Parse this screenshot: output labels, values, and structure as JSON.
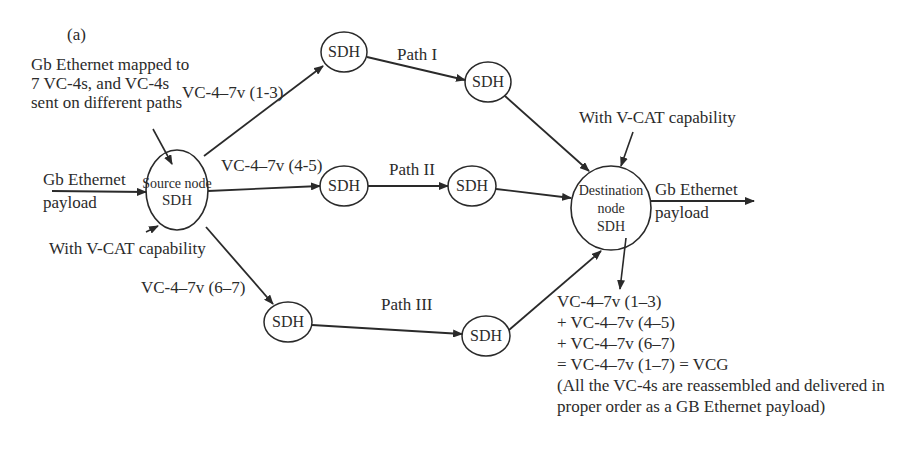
{
  "figure_label": "(a)",
  "annotations": {
    "mapping_note": [
      "Gb Ethernet mapped to",
      "7 VC-4s, and VC-4s",
      "sent on different paths"
    ],
    "input_label": [
      "Gb Ethernet",
      "payload"
    ],
    "source_vcat": "With V-CAT capability",
    "dest_vcat": "With V-CAT capability",
    "output_label": [
      "Gb Ethernet",
      "payload"
    ]
  },
  "nodes": {
    "source": [
      "Source node",
      "SDH"
    ],
    "destination": [
      "Destination",
      "node",
      "SDH"
    ],
    "path1_a": "SDH",
    "path1_b": "SDH",
    "path2_a": "SDH",
    "path2_b": "SDH",
    "path3_a": "SDH",
    "path3_b": "SDH"
  },
  "edges": {
    "vc_1_3": "VC-4–7v (1-3)",
    "vc_4_5": "VC-4–7v (4-5)",
    "vc_6_7": "VC-4–7v (6–7)",
    "path1": "Path I",
    "path2": "Path II",
    "path3": "Path III"
  },
  "reassembly": {
    "lines": [
      "VC-4–7v (1–3)",
      "+ VC-4–7v (4–5)",
      "+ VC-4–7v (6–7)",
      "= VC-4–7v (1–7) = VCG",
      "(All the VC-4s are reassembled and delivered in",
      "proper order as a GB Ethernet payload)"
    ]
  },
  "colors": {
    "stroke": "#2a2a2a",
    "text": "#2b2b2b",
    "background": "#ffffff"
  }
}
